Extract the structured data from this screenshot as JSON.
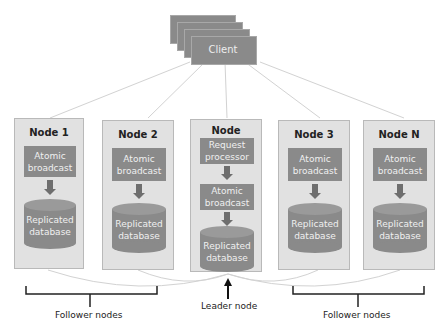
{
  "client": {
    "label": "Client",
    "stack_count": 4
  },
  "nodes": [
    {
      "title": "Node 1",
      "role": "follower",
      "components": [
        "Atomic broadcast",
        "Replicated database"
      ]
    },
    {
      "title": "Node 2",
      "role": "follower",
      "components": [
        "Atomic broadcast",
        "Replicated database"
      ]
    },
    {
      "title": "Node",
      "role": "leader",
      "components": [
        "Request processor",
        "Atomic broadcast",
        "Replicated database"
      ]
    },
    {
      "title": "Node 3",
      "role": "follower",
      "components": [
        "Atomic broadcast",
        "Replicated database"
      ]
    },
    {
      "title": "Node N",
      "role": "follower",
      "components": [
        "Atomic broadcast",
        "Replicated database"
      ]
    }
  ],
  "labels": {
    "follower_left": "Follower nodes",
    "leader": "Leader node",
    "follower_right": "Follower nodes"
  },
  "components": {
    "atomic_1": "Atomic",
    "atomic_2": "broadcast",
    "db_1": "Replicated",
    "db_2": "database",
    "req_1": "Request",
    "req_2": "processor"
  },
  "colors": {
    "box_fill": "#8a8a8a",
    "node_fill": "#e1e1e1",
    "box_text": "#f0f0f0",
    "connector": "#d0d0d0"
  }
}
